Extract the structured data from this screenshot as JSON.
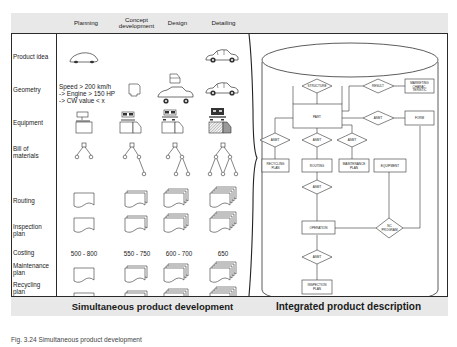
{
  "header": {
    "columns": [
      "Planning",
      "Concept\ndevelopment",
      "Design",
      "Detailing"
    ],
    "columns_split": [
      [
        "Planning"
      ],
      [
        "Concept",
        "development"
      ],
      [
        "Design"
      ],
      [
        "Detailing"
      ]
    ]
  },
  "rows": [
    {
      "label": "Product idea"
    },
    {
      "label": "Geometry"
    },
    {
      "label": "Equipment"
    },
    {
      "label": "Bill of materials"
    },
    {
      "label": "Routing"
    },
    {
      "label": "Inspection plan"
    },
    {
      "label": "Costing"
    },
    {
      "label": "Maintenance plan"
    },
    {
      "label": "Recycling plan"
    }
  ],
  "geometry_requirements": {
    "line1": "Speed > 200 km/h",
    "line2": "-> Engine > 150 HP",
    "line3": "-> CW value < x"
  },
  "costing": {
    "planning": "500 - 800",
    "concept": "550 - 750",
    "design": "600 - 700",
    "detailing": "650"
  },
  "footer": {
    "left": "Simultaneous product development",
    "right": "Integrated product description"
  },
  "er_model": {
    "entities": {
      "part": "PART",
      "marketing": [
        "MARKETING",
        "CHARAC-",
        "TERISTIC"
      ],
      "form": "FORM",
      "recycling_plan": [
        "RECYCLING",
        "PLAN"
      ],
      "routing": "ROUTING",
      "maintenance_plan": [
        "MAINTENANCE",
        "PLAN"
      ],
      "equipment": "EQUIPMENT",
      "operation": "OPERATION",
      "inspection_plan": [
        "INSPECTION",
        "PLAN"
      ]
    },
    "relationships": {
      "structure": "STRUCTURE",
      "result": "RESULT",
      "asmt": "ASMT",
      "nc_program": [
        "NC",
        "PROGRAM"
      ]
    }
  },
  "caption": "Fig. 3.24 Simultaneous product development"
}
